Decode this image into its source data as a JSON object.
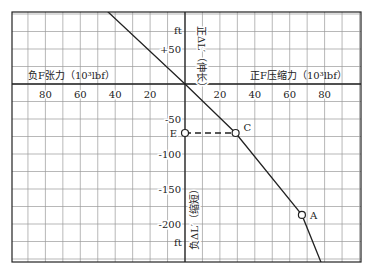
{
  "chart_data": {
    "type": "line",
    "title": "",
    "xlabel_positive": "正F压缩力（10³lbf）",
    "xlabel_negative": "负F张力（10³lbf）",
    "ylabel_positive": "正ΔL′（伸长）",
    "ylabel_negative": "负ΔL′（缩短）",
    "y_unit_top": "ft",
    "y_unit_bottom": "ft",
    "x_ticks_negative": [
      80,
      60,
      40,
      20
    ],
    "x_ticks_positive": [
      20,
      40,
      60,
      80
    ],
    "y_ticks": [
      50,
      -50,
      -100,
      -150,
      -200
    ],
    "y_tick_labels": [
      "+50",
      "-50",
      "-100",
      "-150",
      "-200"
    ],
    "xlim": [
      -100,
      100
    ],
    "ylim": [
      -255,
      105
    ],
    "grid": true,
    "series": [
      {
        "name": "load-deflection line",
        "style": "solid",
        "points": [
          [
            -45,
            105
          ],
          [
            0,
            0
          ],
          [
            29,
            -70
          ],
          [
            67,
            -187
          ],
          [
            78,
            -255
          ]
        ]
      },
      {
        "name": "E-C horizontal",
        "style": "dashed",
        "points": [
          [
            0,
            -70
          ],
          [
            29,
            -70
          ]
        ]
      }
    ],
    "marked_points": [
      {
        "label": "E",
        "x": 0,
        "y": -70
      },
      {
        "label": "C",
        "x": 29,
        "y": -70
      },
      {
        "label": "A",
        "x": 67,
        "y": -187
      }
    ]
  }
}
